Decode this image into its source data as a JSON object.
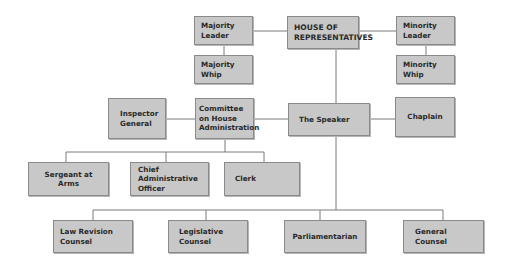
{
  "colors": {
    "box_fill": "#c8c8c8",
    "box_border": "#8a8a8a",
    "line": "#7a7a7a",
    "text": "#2a2a2a"
  },
  "nodes": {
    "house": "HOUSE OF\nREPRESENTATIVES",
    "majority_leader": "Majority\nLeader",
    "majority_whip": "Majority\nWhip",
    "minority_leader": "Minority\nLeader",
    "minority_whip": "Minority\nWhip",
    "inspector_general": "Inspector\nGeneral",
    "committee": "Committee\non House\nAdministration",
    "speaker": "The Speaker",
    "chaplain": "Chaplain",
    "sergeant": "Sergeant at Arms",
    "cao": "Chief\nAdministrative\nOfficer",
    "clerk": "Clerk",
    "law_revision": "Law Revision\nCounsel",
    "legislative": "Legislative\nCounsel",
    "parliamentarian": "Parliamentarian",
    "general_counsel": "General\nCounsel"
  },
  "edges": [
    [
      "house",
      "majority_leader"
    ],
    [
      "house",
      "minority_leader"
    ],
    [
      "majority_leader",
      "majority_whip"
    ],
    [
      "minority_leader",
      "minority_whip"
    ],
    [
      "house",
      "speaker"
    ],
    [
      "speaker",
      "committee"
    ],
    [
      "speaker",
      "chaplain"
    ],
    [
      "committee",
      "inspector_general"
    ],
    [
      "committee",
      "sergeant"
    ],
    [
      "committee",
      "cao"
    ],
    [
      "committee",
      "clerk"
    ],
    [
      "speaker",
      "law_revision"
    ],
    [
      "speaker",
      "legislative"
    ],
    [
      "speaker",
      "parliamentarian"
    ],
    [
      "speaker",
      "general_counsel"
    ]
  ]
}
